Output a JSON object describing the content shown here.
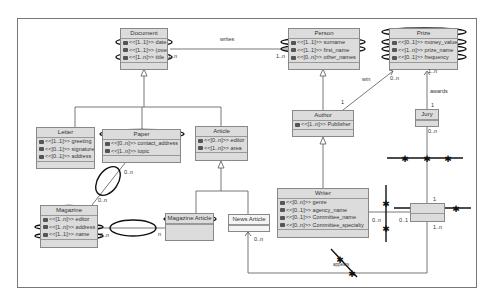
{
  "diagram": {
    "type": "UML class diagram",
    "classes": {
      "document": {
        "name": "Document",
        "attributes": [
          "<<[1..1]>> date",
          "<<[1..1]>> (overlaid)",
          "<<[1..n]>> title"
        ]
      },
      "person": {
        "name": "Person",
        "attributes": [
          "<<[1..1]>> surname",
          "<<[1..1]>> first_name",
          "<<[0..n]>> other_names"
        ]
      },
      "prize": {
        "name": "Prize",
        "attributes": [
          "<<[0..1]>> money_value",
          "<<[1..n]>> prize_name",
          "<<[0..1]>> frequency"
        ]
      },
      "letter": {
        "name": "Letter",
        "attributes": [
          "<<[1..1]>> greeting",
          "<<[0..1]>> signature",
          "<<[0..1]>> address"
        ]
      },
      "paper": {
        "name": "Paper",
        "attributes": [
          "<<[0..n]>> contact_address",
          "<<[1..n]>> topic"
        ]
      },
      "article": {
        "name": "Article",
        "attributes": [
          "<<[0..n]>> editor",
          "<<[1..n]>> area"
        ]
      },
      "author": {
        "name": "Author",
        "attributes": [
          "<<[1..n]>> Publisher"
        ]
      },
      "jury": {
        "name": "Jury",
        "attributes": []
      },
      "magazine": {
        "name": "Magazine",
        "attributes": [
          "<<[1..n]>> editor",
          "<<[1..n]>> address",
          "<<[1..1]>> name"
        ]
      },
      "magazine_article": {
        "name": "Magazine Article",
        "attributes": []
      },
      "news_article": {
        "name": "News Article",
        "attributes": []
      },
      "writer": {
        "name": "Writer",
        "attributes": [
          "<<[0..n]>> genre",
          "<<[0..1]>> agency_name",
          "<<[0..1]>> Committee_name",
          "<<[0..n]>> Committee_specialty"
        ]
      },
      "award_node": {
        "name": "",
        "attributes": []
      }
    },
    "labels": {
      "writes": "writes",
      "win": "win",
      "awards": "awards",
      "appears": "appears",
      "doc_mult": "1..n",
      "person_mult": "1..n",
      "prize_win_mult": "0..n",
      "author_win_mult": "1",
      "prize_award_mult": "1..n",
      "jury_top_mult": "1",
      "jury_bottom_mult": "0..n",
      "paper_mult": "0..n",
      "magazine_top_mult": "0..n",
      "magazine_right_mult": "0..n",
      "magazine_article_mult": "n",
      "news_mult": "0..n",
      "writer_mult": "0..n",
      "award_left_mult": "0..1",
      "award_top_mult": "1",
      "award_bottom_mult": "1..n"
    }
  }
}
